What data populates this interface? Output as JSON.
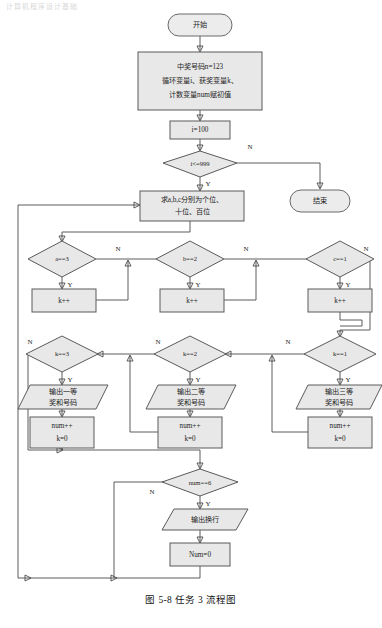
{
  "page": {
    "header_faint": "计算机程序设计基础",
    "caption": "图 5-8  任务 3 流程图"
  },
  "labels": {
    "yes": "Y",
    "no": "N"
  },
  "nodes": {
    "start": {
      "text": "开始",
      "type": "terminal"
    },
    "init": {
      "line1": "中奖号码n=123",
      "line2": "循环变量i、获奖变量k、",
      "line3": "计数变量num赋初值",
      "type": "process"
    },
    "i_init": {
      "text": "i=100",
      "type": "process"
    },
    "loop_cond": {
      "text": "i<=999",
      "type": "decision"
    },
    "end": {
      "text": "结束",
      "type": "terminal"
    },
    "split_digits": {
      "line1": "求a,b,c分别为个位、",
      "line2": "十位、百位",
      "type": "process"
    },
    "check_a": {
      "text": "a==3",
      "type": "decision"
    },
    "check_b": {
      "text": "b==2",
      "type": "decision"
    },
    "check_c": {
      "text": "c==1",
      "type": "decision"
    },
    "inc_k_a": {
      "text": "k++",
      "type": "process"
    },
    "inc_k_b": {
      "text": "k++",
      "type": "process"
    },
    "inc_k_c": {
      "text": "k++",
      "type": "process"
    },
    "check_k3": {
      "text": "k==3",
      "type": "decision"
    },
    "check_k2": {
      "text": "k==2",
      "type": "decision"
    },
    "check_k1": {
      "text": "k==1",
      "type": "decision"
    },
    "out_first": {
      "line1": "输出一等",
      "line2": "奖和号码",
      "type": "io"
    },
    "out_second": {
      "line1": "输出二等",
      "line2": "奖和号码",
      "type": "io"
    },
    "out_third": {
      "line1": "输出三等",
      "line2": "奖和号码",
      "type": "io"
    },
    "num_k_a": {
      "line1": "num++",
      "line2": "k=0",
      "type": "process"
    },
    "num_k_b": {
      "line1": "num++",
      "line2": "k=0",
      "type": "process"
    },
    "num_k_c": {
      "line1": "num++",
      "line2": "k=0",
      "type": "process"
    },
    "check_num6": {
      "text": "num==6",
      "type": "decision"
    },
    "out_newline": {
      "text": "输出换行",
      "type": "io"
    },
    "reset_num": {
      "text": "Num=0",
      "type": "process"
    }
  },
  "colors": {
    "shape_fill": "#e8e8e8",
    "shape_stroke": "#5a5a5a",
    "edge_stroke": "#4a4a4a",
    "text": "#1d1d1d",
    "background": "#ffffff"
  }
}
